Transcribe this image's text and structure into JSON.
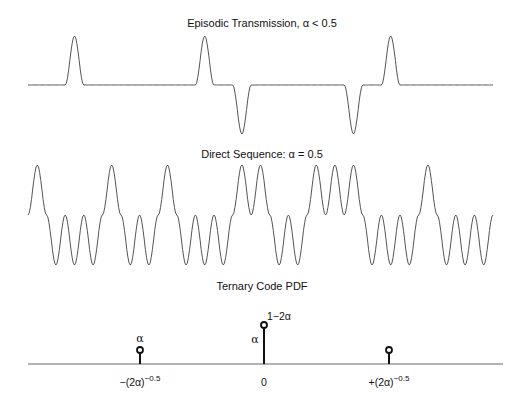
{
  "chart_data": [
    {
      "type": "line",
      "title": "Episodic Transmission, α < 0.5",
      "description": "Sparse ternary pulse train; pulses at slots with values +1/-1, zeros elsewhere",
      "n_slots": 25,
      "symbols": [
        0,
        0,
        1,
        0,
        0,
        0,
        0,
        0,
        0,
        1,
        0,
        -1,
        0,
        0,
        0,
        0,
        0,
        -1,
        0,
        1,
        0,
        0,
        0,
        0,
        0
      ],
      "xlabel": "",
      "ylabel": "",
      "grid": false
    },
    {
      "type": "line",
      "title": "Direct Sequence: α = 0.5",
      "description": "Dense binary pulse train; every slot is +1 or -1",
      "n_slots": 25,
      "symbols": [
        1,
        -1,
        -1,
        -1,
        1,
        -1,
        -1,
        1,
        -1,
        -1,
        -1,
        1,
        1,
        -1,
        -1,
        1,
        1,
        1,
        -1,
        -1,
        -1,
        1,
        -1,
        -1,
        -1
      ],
      "xlabel": "",
      "ylabel": "",
      "grid": false
    },
    {
      "type": "stem",
      "title": "Ternary Code PDF",
      "categories": [
        "-(2α)^-0.5",
        "0",
        "+(2α)^-0.5"
      ],
      "values": [
        "α",
        "1-2α",
        "α"
      ],
      "relative_heights": [
        0.35,
        1.0,
        0.35
      ],
      "annotations": [
        "α",
        "1−2α",
        "α"
      ],
      "xlabel": "",
      "ylabel": "",
      "grid": false
    }
  ],
  "panels": {
    "top": {
      "title": "Episodic Transmission, α < 0.5"
    },
    "middle": {
      "title": "Direct Sequence: α = 0.5"
    },
    "bottom": {
      "title": "Ternary Code PDF",
      "ticks": {
        "left": {
          "base": "−(2α)",
          "exp": "−0.5"
        },
        "center": "0",
        "right": {
          "base": "+(2α)",
          "exp": "−0.5"
        }
      },
      "labels": {
        "left_prob": "α",
        "center_prob": "1−2α",
        "center_alpha": "α"
      }
    }
  }
}
